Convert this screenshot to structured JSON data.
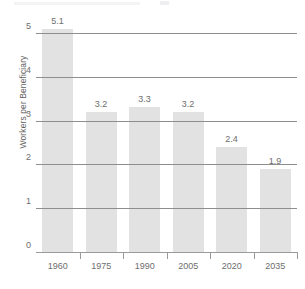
{
  "chart_data": {
    "type": "bar",
    "title": "",
    "xlabel": "",
    "ylabel": "Workers per Beneficiary",
    "categories": [
      "1960",
      "1975",
      "1990",
      "2005",
      "2020",
      "2035"
    ],
    "values": [
      5.1,
      3.2,
      3.3,
      3.2,
      2.4,
      1.9
    ],
    "value_labels": [
      "5.1",
      "3.2",
      "3.3",
      "3.2",
      "2.4",
      "1.9"
    ],
    "ylim": [
      0,
      5
    ],
    "y_ticks": [
      0,
      1,
      2,
      3,
      4,
      5
    ],
    "y_tick_labels": [
      "0",
      "1",
      "2",
      "3",
      "4",
      "5"
    ],
    "grid": true,
    "legend": "none",
    "bar_color": "#e2e2e2",
    "gridline_color": "#8e8e8e",
    "text_color": "#6e6e6e"
  }
}
